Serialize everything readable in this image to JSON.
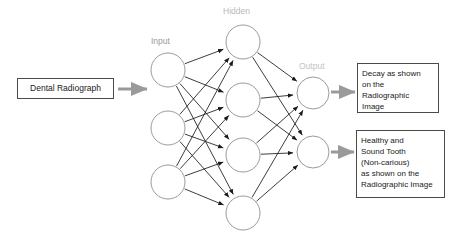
{
  "diagram": {
    "type": "neural-network-flow",
    "background_color": "#ffffff",
    "node_stroke_color": "#8e8e8e",
    "synapse_color": "#1a1a1a",
    "flow_arrow_color": "#9a9a9a",
    "box_border_color": "#4a4a4a",
    "input_box": {
      "text": "Dental Radiograph"
    },
    "layer_labels": {
      "input": "Input",
      "hidden": "Hidden",
      "output": "Output"
    },
    "layer_label_colors": {
      "input": "#9a9a9a",
      "hidden": "#b9b9b9",
      "output": "#c3c3c3"
    },
    "outcome_boxes": [
      {
        "name": "decay",
        "lines": [
          "Decay as shown",
          "on the",
          "Radiographic",
          "Image"
        ]
      },
      {
        "name": "healthy",
        "lines": [
          "Healthy and",
          "Sound Tooth",
          "(Non-carious)",
          "as shown on the",
          "Radiographic Image"
        ]
      }
    ],
    "layers": {
      "input": {
        "count": 3,
        "radius": 17,
        "nodes": [
          {
            "cx": 168,
            "cy": 70
          },
          {
            "cx": 168,
            "cy": 128
          },
          {
            "cx": 168,
            "cy": 182
          }
        ]
      },
      "hidden": {
        "count": 4,
        "radius": 17,
        "nodes": [
          {
            "cx": 243,
            "cy": 42
          },
          {
            "cx": 243,
            "cy": 100
          },
          {
            "cx": 243,
            "cy": 155
          },
          {
            "cx": 243,
            "cy": 213
          }
        ]
      },
      "output": {
        "count": 2,
        "radius": 16,
        "nodes": [
          {
            "cx": 313,
            "cy": 93
          },
          {
            "cx": 313,
            "cy": 152
          }
        ]
      }
    },
    "flow_arrows": [
      {
        "name": "source-to-network",
        "x1": 118,
        "y1": 89,
        "x2": 147,
        "y2": 89
      },
      {
        "name": "output-1-to-decay",
        "x1": 331,
        "y1": 92,
        "x2": 355,
        "y2": 92
      },
      {
        "name": "output-2-to-healthy",
        "x1": 331,
        "y1": 152,
        "x2": 354,
        "y2": 152
      }
    ]
  }
}
